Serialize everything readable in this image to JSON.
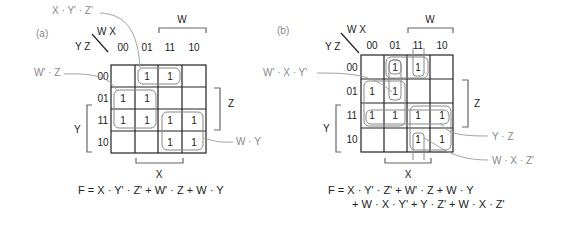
{
  "maps": [
    {
      "tag": "(a)",
      "var_cols": "W X",
      "var_rows": "Y Z",
      "col_headers": [
        "00",
        "01",
        "11",
        "10"
      ],
      "row_headers": [
        "00",
        "01",
        "11",
        "10"
      ],
      "cells": [
        [
          "",
          "1",
          "1",
          ""
        ],
        [
          "1",
          "1",
          "",
          ""
        ],
        [
          "1",
          "1",
          "1",
          "1"
        ],
        [
          "",
          "",
          "1",
          "1"
        ]
      ],
      "bracket_labels": {
        "W": "W",
        "Z": "Z",
        "Y": "Y",
        "X": "X"
      },
      "term_labels": [
        "X · Y' · Z'",
        "W' · Z",
        "W · Y"
      ],
      "equation": [
        "F = X · Y' · Z' + W' · Z + W · Y"
      ]
    },
    {
      "tag": "(b)",
      "var_cols": "W X",
      "var_rows": "Y Z",
      "col_headers": [
        "00",
        "01",
        "11",
        "10"
      ],
      "row_headers": [
        "00",
        "01",
        "11",
        "10"
      ],
      "cells": [
        [
          "",
          "1",
          "1",
          ""
        ],
        [
          "1",
          "1",
          "",
          ""
        ],
        [
          "1",
          "1",
          "1",
          "1"
        ],
        [
          "",
          "",
          "1",
          "1"
        ]
      ],
      "bracket_labels": {
        "W": "W",
        "Z": "Z",
        "Y": "Y",
        "X": "X"
      },
      "term_labels": [
        "W' · X · Y'",
        "Y · Z",
        "W · X · Z'"
      ],
      "equation": [
        "F = X · Y' · Z' + W' · Z + W · Y",
        "+ W · X · Y' + Y · Z' + W · X · Z'"
      ]
    }
  ]
}
